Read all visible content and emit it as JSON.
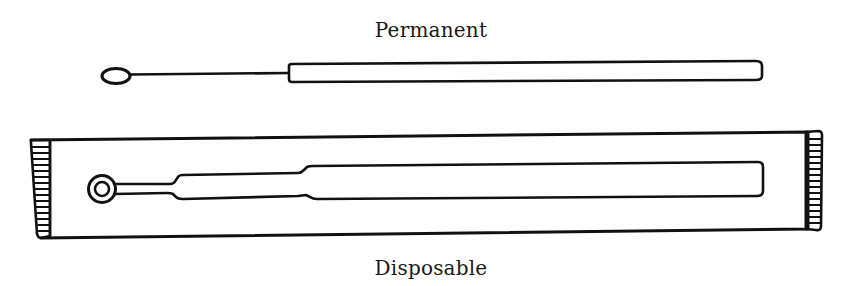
{
  "figure": {
    "labels": {
      "top": "Permanent",
      "bottom": "Disposable"
    },
    "items": [
      {
        "name": "permanent-loop",
        "description": "Metal loop with oval tip, wire shaft and cylindrical handle"
      },
      {
        "name": "disposable-loop",
        "description": "Plastic loop with ring tip, stepped shaft, inside sealed wrapper with crimped ends"
      }
    ],
    "colors": {
      "ink": "#111111",
      "background": "#ffffff"
    }
  }
}
